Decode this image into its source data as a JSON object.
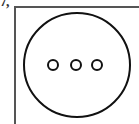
{
  "figure": {
    "label_fragment": "7,",
    "frame": {
      "stroke": "#555555"
    },
    "outer_circle": {
      "cx": 77,
      "cy": 65,
      "rx": 53,
      "ry": 52,
      "stroke": "#111111",
      "stroke_width": 2
    },
    "inner_circles": [
      {
        "cx": 53,
        "cy": 65,
        "r": 5
      },
      {
        "cx": 76,
        "cy": 65,
        "r": 5
      },
      {
        "cx": 97,
        "cy": 65,
        "r": 5
      }
    ]
  }
}
